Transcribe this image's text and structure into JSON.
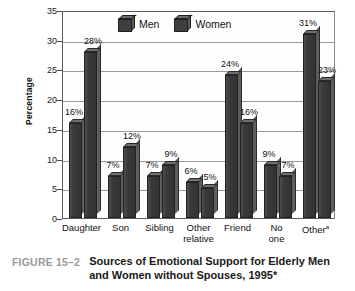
{
  "figure": {
    "number_label": "FIGURE 15–2",
    "caption": "Sources of Emotional Support for Elderly Men and Women without Spouses, 1995*"
  },
  "legend": {
    "position": "top-center",
    "entries": [
      {
        "label": "Men",
        "icon": "cube-icon",
        "color": "#3f3f3f"
      },
      {
        "label": "Women",
        "icon": "cube-icon",
        "color": "#3f3f3f"
      }
    ]
  },
  "axes": {
    "ylabel": "Percentage",
    "yticks": [
      "0",
      "5",
      "10",
      "15",
      "20",
      "25",
      "30",
      "35"
    ]
  },
  "chart_data": {
    "type": "bar",
    "title": "Sources of Emotional Support for Elderly Men and Women without Spouses, 1995*",
    "xlabel": "",
    "ylabel": "Percentage",
    "ylim": [
      0,
      35
    ],
    "ytick_step": 5,
    "grid": true,
    "legend_position": "top-center",
    "categories": [
      "Daughter",
      "Son",
      "Sibling",
      "Other relative",
      "Friend",
      "No one",
      "Otherᵃ"
    ],
    "series": [
      {
        "name": "Men",
        "values": [
          16,
          7,
          7,
          6,
          24,
          9,
          31
        ],
        "labels": [
          "16%",
          "7%",
          "7%",
          "6%",
          "24%",
          "9%",
          "31%"
        ]
      },
      {
        "name": "Women",
        "values": [
          28,
          12,
          9,
          5,
          16,
          7,
          23
        ],
        "labels": [
          "28%",
          "12%",
          "9%",
          "5%",
          "16%",
          "7%",
          "23%"
        ]
      }
    ]
  }
}
